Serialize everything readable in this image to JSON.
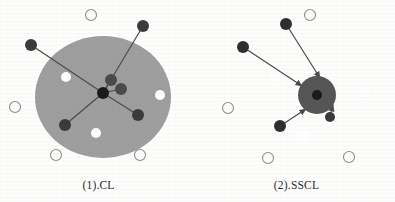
{
  "figure": {
    "background_color": "#fdfdfc",
    "panels": [
      {
        "id": "cl",
        "caption": "(1).CL",
        "cluster": {
          "fill": "#9e9e9e",
          "cx": 103,
          "cy": 97,
          "rx": 68,
          "ry": 61
        },
        "anchor": {
          "label": "anchor-node",
          "fill": "#1a1a1a",
          "cx": 103,
          "cy": 93,
          "r": 6
        },
        "inner_cluster": null,
        "positive_samples": [
          {
            "cx": 111,
            "cy": 80,
            "r": 6,
            "fill": "#4a4a4a"
          },
          {
            "cx": 121,
            "cy": 89,
            "r": 6,
            "fill": "#4a4a4a"
          }
        ],
        "negative_samples": [
          {
            "cx": 143,
            "cy": 26,
            "r": 6,
            "fill": "#3a3a3a"
          },
          {
            "cx": 31,
            "cy": 45,
            "r": 6,
            "fill": "#3a3a3a"
          },
          {
            "cx": 65,
            "cy": 125,
            "r": 6,
            "fill": "#3a3a3a"
          },
          {
            "cx": 138,
            "cy": 115,
            "r": 6,
            "fill": "#3a3a3a"
          }
        ],
        "edges": [
          {
            "x1": 143,
            "y1": 26,
            "x2": 103,
            "y2": 93,
            "arrow": false
          },
          {
            "x1": 31,
            "y1": 45,
            "x2": 103,
            "y2": 93,
            "arrow": false
          },
          {
            "x1": 65,
            "y1": 125,
            "x2": 103,
            "y2": 93,
            "arrow": false
          },
          {
            "x1": 138,
            "y1": 115,
            "x2": 103,
            "y2": 93,
            "arrow": false
          },
          {
            "x1": 111,
            "y1": 80,
            "x2": 103,
            "y2": 93,
            "arrow": false
          },
          {
            "x1": 121,
            "y1": 89,
            "x2": 103,
            "y2": 93,
            "arrow": false
          }
        ],
        "inside_open_circles": [
          {
            "cx": 66,
            "cy": 77,
            "r": 5,
            "fill": "#ffffff"
          },
          {
            "cx": 160,
            "cy": 95,
            "r": 5,
            "fill": "#ffffff"
          },
          {
            "cx": 96,
            "cy": 133,
            "r": 5,
            "fill": "#ffffff"
          }
        ],
        "outside_open_circles": [
          {
            "cx": 91,
            "cy": 15,
            "r": 5.5
          },
          {
            "cx": 15,
            "cy": 107,
            "r": 5.5
          },
          {
            "cx": 56,
            "cy": 155,
            "r": 5.5
          },
          {
            "cx": 140,
            "cy": 155,
            "r": 5.5
          }
        ]
      },
      {
        "id": "sscl",
        "caption": "(2).SSCL",
        "cluster": {
          "fill": "#9e9e9e",
          "cx": 110,
          "cy": 94,
          "rx": 59,
          "ry": 62
        },
        "anchor": {
          "label": "anchor-node",
          "fill": "#1a1a1a",
          "cx": 119,
          "cy": 95,
          "r": 5
        },
        "inner_cluster": {
          "label": "sub-cluster",
          "fill": "#555555",
          "cx": 119,
          "cy": 95,
          "r": 19
        },
        "positive_samples": [],
        "negative_samples": [
          {
            "cx": 286,
            "cy": 24,
            "r": 6,
            "fill": "#2e2e2e"
          },
          {
            "cx": 243,
            "cy": 47,
            "r": 6,
            "fill": "#2e2e2e"
          },
          {
            "cx": 280,
            "cy": 126,
            "r": 6,
            "fill": "#2e2e2e"
          },
          {
            "cx": 330,
            "cy": 117,
            "r": 5,
            "fill": "#3a3a3a"
          }
        ],
        "edges": [
          {
            "x1": 286,
            "y1": 24,
            "x2": 320,
            "y2": 78,
            "arrow": true
          },
          {
            "x1": 243,
            "y1": 47,
            "x2": 302,
            "y2": 86,
            "arrow": true
          },
          {
            "x1": 280,
            "y1": 126,
            "x2": 306,
            "y2": 109,
            "arrow": true
          },
          {
            "x1": 330,
            "y1": 117,
            "x2": 333,
            "y2": 105,
            "arrow": true
          }
        ],
        "inside_open_circles": [
          {
            "cx": 275,
            "cy": 78,
            "r": 5,
            "fill": "#ffffff"
          },
          {
            "cx": 365,
            "cy": 92,
            "r": 5,
            "fill": "#ffffff"
          },
          {
            "cx": 305,
            "cy": 136,
            "r": 5,
            "fill": "#ffffff"
          }
        ],
        "outside_open_circles": [
          {
            "cx": 310,
            "cy": 15,
            "r": 5.5
          },
          {
            "cx": 228,
            "cy": 108,
            "r": 5.5
          },
          {
            "cx": 268,
            "cy": 158,
            "r": 5.5
          },
          {
            "cx": 349,
            "cy": 157,
            "r": 5.5
          }
        ]
      }
    ],
    "style": {
      "cluster_fill": "#9e9e9e",
      "subcluster_fill": "#555555",
      "node_dark_fill": "#333333",
      "anchor_fill": "#141414",
      "open_circle_stroke": "#8d8d8d",
      "edge_stroke": "#4b4b4b",
      "caption_color": "#2b2b2b"
    }
  }
}
